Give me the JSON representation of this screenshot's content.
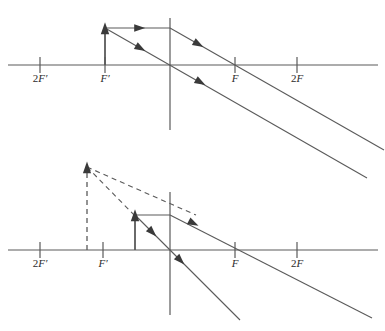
{
  "figure": {
    "type": "optics-ray-diagram",
    "stroke_color": "#5a5a5a",
    "label_color": "#2b2b2b",
    "background_color": "#ffffff",
    "width": 385,
    "height": 331
  },
  "diagrams": [
    {
      "id": "diagram-top",
      "caption": "",
      "axis": {
        "y": 65,
        "x_start": 8,
        "x_end": 378
      },
      "lens": {
        "x": 170,
        "y_top": 18,
        "y_bottom": 130
      },
      "ticks": [
        {
          "name": "2F-prime",
          "x": 40,
          "label_number": "2",
          "label_letter": "F",
          "label_prime": "′",
          "label_text": "2F′",
          "label_x": 40,
          "label_y": 82
        },
        {
          "name": "F-prime",
          "x": 105,
          "label_number": "",
          "label_letter": "F",
          "label_prime": "′",
          "label_text": "F′",
          "label_x": 105,
          "label_y": 82
        },
        {
          "name": "F",
          "x": 235,
          "label_number": "",
          "label_letter": "F",
          "label_prime": "",
          "label_text": "F",
          "label_x": 235,
          "label_y": 82
        },
        {
          "name": "2F",
          "x": 297,
          "label_number": "2",
          "label_letter": "F",
          "label_prime": "",
          "label_text": "2F",
          "label_x": 297,
          "label_y": 82
        }
      ],
      "object_arrow": {
        "x": 105,
        "y_base": 65,
        "y_tip": 28,
        "style": "solid"
      },
      "rays": [
        {
          "name": "parallel-incident-ray",
          "x1": 105,
          "y1": 28,
          "x2": 170,
          "y2": 28,
          "style": "solid",
          "arrow_at": {
            "x": 139,
            "y": 28,
            "angle": 0
          }
        },
        {
          "name": "refracted-through-focus-ray",
          "x1": 170,
          "y1": 28,
          "x2": 384,
          "y2": 150,
          "style": "solid",
          "arrow_at": {
            "x": 198,
            "y": 44,
            "angle": 29.7
          }
        },
        {
          "name": "center-ray",
          "x1": 105,
          "y1": 28,
          "x2": 367,
          "y2": 178,
          "style": "solid",
          "arrow_at": {
            "x": 140,
            "y": 48,
            "angle": 29.8
          }
        },
        {
          "name": "center-ray-second-arrow",
          "x1": 195,
          "y1": 80,
          "x2": 230,
          "y2": 100,
          "style": "none",
          "arrow_at": {
            "x": 200,
            "y": 82,
            "angle": 29.8
          }
        }
      ],
      "dashed_lines": []
    },
    {
      "id": "diagram-bottom",
      "caption": "",
      "axis": {
        "y": 250,
        "x_start": 8,
        "x_end": 378
      },
      "lens": {
        "x": 170,
        "y_top": 192,
        "y_bottom": 315
      },
      "ticks": [
        {
          "name": "2F-prime",
          "x": 40,
          "label_number": "2",
          "label_letter": "F",
          "label_prime": "′",
          "label_text": "2F′",
          "label_x": 40,
          "label_y": 267
        },
        {
          "name": "F-prime",
          "x": 103,
          "label_number": "",
          "label_letter": "F",
          "label_prime": "′",
          "label_text": "F′",
          "label_x": 103,
          "label_y": 267
        },
        {
          "name": "F",
          "x": 235,
          "label_number": "",
          "label_letter": "F",
          "label_prime": "",
          "label_text": "F",
          "label_x": 235,
          "label_y": 267
        },
        {
          "name": "2F",
          "x": 297,
          "label_number": "2",
          "label_letter": "F",
          "label_prime": "",
          "label_text": "2F",
          "label_x": 297,
          "label_y": 267
        }
      ],
      "object_arrow": {
        "x": 135,
        "y_base": 250,
        "y_tip": 215,
        "style": "solid"
      },
      "image_arrow": {
        "x": 87,
        "y_base": 250,
        "y_tip": 167,
        "style": "dashed"
      },
      "rays": [
        {
          "name": "parallel-incident-ray",
          "x1": 135,
          "y1": 215,
          "x2": 170,
          "y2": 215,
          "style": "solid",
          "arrow_at": null
        },
        {
          "name": "refracted-through-focus-ray",
          "x1": 170,
          "y1": 215,
          "x2": 372,
          "y2": 318,
          "style": "solid",
          "arrow_at": {
            "x": 193,
            "y": 223,
            "angle": 27.0
          }
        },
        {
          "name": "center-ray",
          "x1": 135,
          "y1": 215,
          "x2": 240,
          "y2": 320,
          "style": "solid",
          "arrow_at": {
            "x": 152,
            "y": 232,
            "angle": 45.0
          }
        },
        {
          "name": "center-ray-second-arrow",
          "x1": 175,
          "y1": 255,
          "x2": 200,
          "y2": 280,
          "style": "none",
          "arrow_at": {
            "x": 180,
            "y": 260,
            "angle": 45.0
          }
        }
      ],
      "dashed_lines": [
        {
          "name": "virtual-ray-upper",
          "x1": 87,
          "y1": 167,
          "x2": 196,
          "y2": 215
        },
        {
          "name": "virtual-ray-lower",
          "x1": 87,
          "y1": 167,
          "x2": 137,
          "y2": 218
        }
      ]
    }
  ]
}
